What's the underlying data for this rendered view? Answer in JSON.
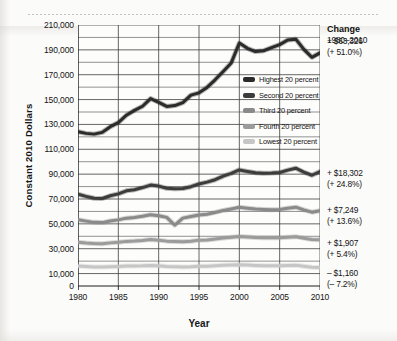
{
  "chart_data": {
    "type": "line",
    "title": "",
    "xlabel": "Year",
    "ylabel": "Constant 2010 Dollars",
    "xlim": [
      1980,
      2010
    ],
    "ylim": [
      0,
      210000
    ],
    "grid": true,
    "legend_position": "inside-right",
    "y_ticks": [
      0,
      10000,
      30000,
      50000,
      70000,
      90000,
      110000,
      130000,
      150000,
      170000,
      190000,
      210000
    ],
    "y_tick_labels": [
      "0",
      "10,000",
      "30,000",
      "50,000",
      "70,000",
      "90,000",
      "110,000",
      "130,000",
      "150,000",
      "170,000",
      "190,000",
      "210,000"
    ],
    "y_minor_step": 10000,
    "x_ticks": [
      1980,
      1985,
      1990,
      1995,
      2000,
      2005,
      2010
    ],
    "x_tick_labels": [
      "1980",
      "1985",
      "1990",
      "1995",
      "2000",
      "2005",
      "2010"
    ],
    "x": [
      1980,
      1981,
      1982,
      1983,
      1984,
      1985,
      1986,
      1987,
      1988,
      1989,
      1990,
      1991,
      1992,
      1993,
      1994,
      1995,
      1996,
      1997,
      1998,
      1999,
      2000,
      2001,
      2002,
      2003,
      2004,
      2005,
      2006,
      2007,
      2008,
      2009,
      2010
    ],
    "series": [
      {
        "name": "Highest 20 percent",
        "color": "#2b2b2b",
        "values": [
          124200,
          122800,
          122200,
          123600,
          128200,
          131500,
          137400,
          141300,
          144600,
          150800,
          147800,
          144500,
          145200,
          147600,
          153600,
          155400,
          159800,
          165900,
          172600,
          179500,
          195500,
          191200,
          188600,
          189300,
          191800,
          194200,
          197900,
          198600,
          190400,
          184000,
          187526
        ]
      },
      {
        "name": "Second 20 percent",
        "color": "#3c3c3c",
        "values": [
          73800,
          72100,
          70600,
          70400,
          72600,
          74100,
          76600,
          77500,
          79200,
          81200,
          80400,
          78600,
          78200,
          78400,
          79900,
          82100,
          83600,
          85500,
          88400,
          90600,
          93400,
          92200,
          91100,
          90700,
          90900,
          91300,
          93200,
          94800,
          91600,
          89100,
          92102
        ]
      },
      {
        "name": "Third 20 percent",
        "color": "#8a8a8a",
        "values": [
          53300,
          52200,
          51200,
          51000,
          52300,
          53200,
          54600,
          55200,
          56100,
          57400,
          56500,
          55200,
          48900,
          54600,
          55900,
          57100,
          57800,
          59200,
          60800,
          62000,
          63300,
          62600,
          61900,
          61600,
          61400,
          61500,
          62600,
          63400,
          61200,
          59400,
          60549
        ]
      },
      {
        "name": "Fourth 20 percent",
        "color": "#9b9b9b",
        "values": [
          35300,
          34600,
          34100,
          34000,
          34700,
          35200,
          35900,
          36200,
          36700,
          37400,
          36900,
          36100,
          35800,
          35600,
          36000,
          36900,
          37100,
          37800,
          38600,
          39300,
          39900,
          39500,
          39100,
          38900,
          38800,
          38800,
          39300,
          39700,
          38500,
          37400,
          37207
        ]
      },
      {
        "name": "Lowest 20 percent",
        "color": "#c6c6c6",
        "values": [
          16100,
          15700,
          15300,
          15200,
          15500,
          15700,
          16000,
          16100,
          16200,
          16500,
          16200,
          15700,
          15400,
          15200,
          15400,
          15800,
          15900,
          16200,
          16600,
          16900,
          17100,
          16800,
          16500,
          16300,
          16200,
          16300,
          16500,
          16700,
          15900,
          15100,
          14940
        ]
      }
    ],
    "annotations": {
      "heading": "Change",
      "period": "1980–2010",
      "items": [
        {
          "series": "Highest 20 percent",
          "amount": "+ $63,326",
          "percent": "(+ 51.0%)"
        },
        {
          "series": "Second 20 percent",
          "amount": "+ $18,302",
          "percent": "(+ 24.8%)"
        },
        {
          "series": "Third 20 percent",
          "amount": "+ $7,249",
          "percent": "(+ 13.6%)"
        },
        {
          "series": "Fourth 20 percent",
          "amount": "+ $1,907",
          "percent": "(+ 5.4%)"
        },
        {
          "series": "Lowest 20 percent",
          "amount": "– $1,160",
          "percent": "(– 7.2%)"
        }
      ]
    }
  }
}
